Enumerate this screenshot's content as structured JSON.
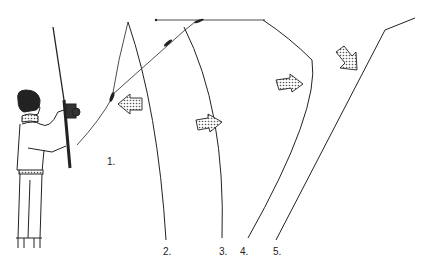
{
  "diagram": {
    "labels": [
      {
        "id": "1",
        "text": "1.",
        "x": 107,
        "y": 163
      },
      {
        "id": "2",
        "text": "2.",
        "x": 163,
        "y": 248
      },
      {
        "id": "3",
        "text": "3.",
        "x": 219,
        "y": 248
      },
      {
        "id": "4",
        "text": "4.",
        "x": 240,
        "y": 248
      },
      {
        "id": "5",
        "text": "5.",
        "x": 273,
        "y": 248
      }
    ],
    "arrows": [
      {
        "id": "arrow-back",
        "direction": "left",
        "x": 118,
        "y": 100
      },
      {
        "id": "arrow-forward-1",
        "direction": "right",
        "x": 196,
        "y": 118
      },
      {
        "id": "arrow-forward-2",
        "direction": "right",
        "x": 276,
        "y": 78
      },
      {
        "id": "arrow-down-right",
        "direction": "down-right",
        "x": 335,
        "y": 48
      }
    ],
    "colors": {
      "ink": "#222222",
      "stipple": "#cccccc"
    }
  }
}
